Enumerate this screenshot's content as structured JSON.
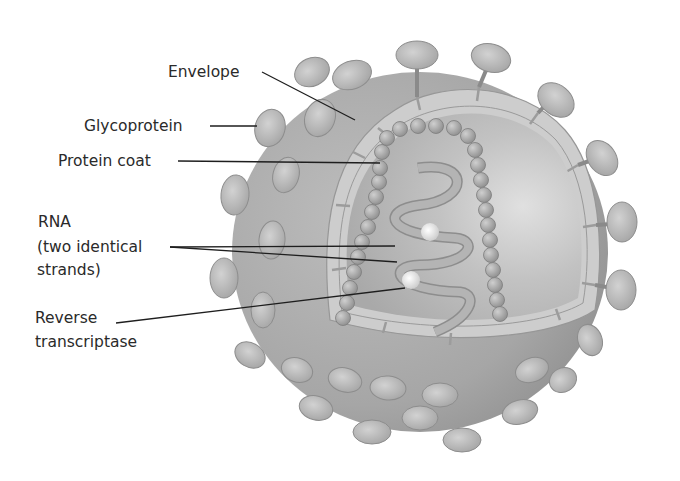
{
  "figure": {
    "colors": {
      "background": "#ffffff",
      "virus_shell": "#a9a9a9",
      "envelope_band": "#cfcfcf",
      "inner_core": "#b7b7b7",
      "label_text": "#2a2a2a",
      "leader_line": "#1e1e1e"
    }
  },
  "labels": {
    "envelope": "Envelope",
    "glycoprotein": "Glycoprotein",
    "protein_coat": "Protein coat",
    "rna_line1": "RNA",
    "rna_line2": "(two identical",
    "rna_line3": "strands)",
    "reverse_transcriptase_line1": "Reverse",
    "reverse_transcriptase_line2": "transcriptase"
  }
}
